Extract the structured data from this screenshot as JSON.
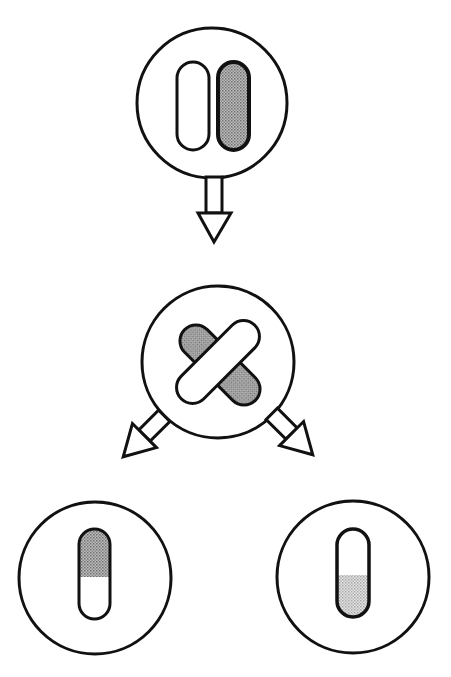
{
  "diagram": {
    "colors": {
      "stroke": "#111111",
      "background": "#ffffff",
      "shade_dark": "#9a9a9a",
      "shade_light": "#c8c8c8"
    },
    "nodes": [
      {
        "id": "parent-cell",
        "label": "Cell with homologous pair",
        "circle": {
          "cx": 212,
          "cy": 103,
          "r": 75
        },
        "chromosomes": [
          {
            "shade": "none",
            "x": 177,
            "y": 62,
            "w": 32,
            "h": 88
          },
          {
            "shade": "dark",
            "x": 218,
            "y": 62,
            "w": 31,
            "h": 88
          }
        ]
      },
      {
        "id": "crossover-cell",
        "label": "Crossing over",
        "circle": {
          "cx": 218,
          "cy": 362,
          "r": 76
        },
        "chromosomes": [
          {
            "shade": "dark",
            "cx": 220,
            "cy": 365,
            "length": 100,
            "width": 32,
            "angle": 45
          },
          {
            "shade": "none",
            "cx": 218,
            "cy": 362,
            "length": 104,
            "width": 32,
            "angle": -45
          }
        ]
      },
      {
        "id": "daughter-cell-left",
        "label": "Recombinant chromosome (dark top)",
        "circle": {
          "cx": 95,
          "cy": 578,
          "r": 76
        },
        "chromosome": {
          "x": 79,
          "y": 529,
          "w": 31,
          "h": 90,
          "split_y": 577,
          "shaded_part": "top",
          "shade": "dark"
        }
      },
      {
        "id": "daughter-cell-right",
        "label": "Recombinant chromosome (light bottom)",
        "circle": {
          "cx": 353,
          "cy": 577,
          "r": 76
        },
        "chromosome": {
          "x": 337,
          "y": 529,
          "w": 32,
          "h": 88,
          "split_y": 575,
          "shaded_part": "bottom",
          "shade": "light"
        }
      }
    ],
    "arrows": [
      {
        "id": "arrow-down",
        "from": "parent-cell",
        "to": "crossover-cell",
        "direction": "down"
      },
      {
        "id": "arrow-left",
        "from": "crossover-cell",
        "to": "daughter-cell-left",
        "direction": "down-left"
      },
      {
        "id": "arrow-right",
        "from": "crossover-cell",
        "to": "daughter-cell-right",
        "direction": "down-right"
      }
    ]
  }
}
